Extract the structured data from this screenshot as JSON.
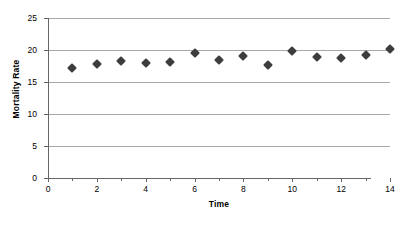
{
  "chart_data": {
    "type": "scatter",
    "title": "",
    "xlabel": "Time",
    "ylabel": "Mortality Rate",
    "x": [
      1,
      2,
      3,
      4,
      5,
      6,
      7,
      8,
      9,
      10,
      11,
      12,
      13,
      14
    ],
    "values": [
      17.2,
      17.8,
      18.3,
      18.0,
      18.2,
      19.5,
      18.5,
      19.1,
      17.6,
      19.9,
      18.9,
      18.7,
      19.2,
      20.1
    ],
    "series": [
      {
        "name": "Mortality Rate",
        "values": [
          17.2,
          17.8,
          18.3,
          18.0,
          18.2,
          19.5,
          18.5,
          19.1,
          17.6,
          19.9,
          18.9,
          18.7,
          19.2,
          20.1
        ]
      }
    ],
    "xlim": [
      0,
      14
    ],
    "ylim": [
      0,
      25
    ],
    "xticks": [
      0,
      2,
      4,
      6,
      8,
      10,
      12,
      14
    ],
    "xtick_labels": [
      "0",
      "2",
      "4",
      "6",
      "8",
      "10",
      "12",
      "14"
    ],
    "xminor_ticks": [
      1,
      3,
      5,
      7,
      9,
      11,
      13
    ],
    "yticks": [
      0,
      5,
      10,
      15,
      20,
      25
    ],
    "ytick_labels": [
      "0",
      "5",
      "10",
      "15",
      "20",
      "25"
    ],
    "grid": "horizontal",
    "legend": "none",
    "marker_shape": "diamond",
    "marker_color": "#3d3d3d",
    "gridline_color": "#a8a8a8",
    "axis_color": "#666666",
    "background_color": "#ffffff"
  }
}
